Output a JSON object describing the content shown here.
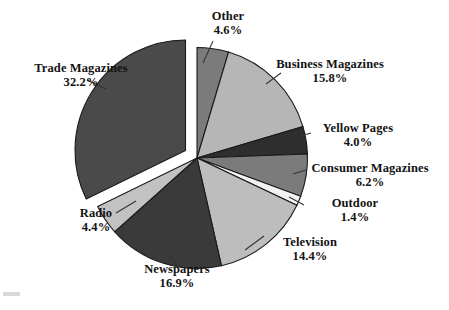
{
  "chart_data": {
    "type": "pie",
    "title": "",
    "subtitle": "",
    "xlabel": "",
    "ylabel": "",
    "units": "percent",
    "legend_position": "none",
    "labels_position": "outside-with-leader-lines",
    "grid": false,
    "start_angle_deg": 0,
    "direction": "clockwise",
    "total": 99.9,
    "categories": [
      "Other",
      "Business Magazines",
      "Yellow Pages",
      "Consumer Magazines",
      "Outdoor",
      "Television",
      "Newspapers",
      "Radio",
      "Trade Magazines"
    ],
    "values": [
      4.6,
      15.8,
      4.0,
      6.2,
      1.4,
      14.4,
      16.9,
      4.4,
      32.2
    ],
    "slices": [
      {
        "name": "Other",
        "value": 4.6,
        "value_text": "4.6%",
        "color": "#7b7b7b",
        "exploded": false
      },
      {
        "name": "Business Magazines",
        "value": 15.8,
        "value_text": "15.8%",
        "color": "#b6b6b6",
        "exploded": false
      },
      {
        "name": "Yellow Pages",
        "value": 4.0,
        "value_text": "4.0%",
        "color": "#2e2e2e",
        "exploded": false
      },
      {
        "name": "Consumer Magazines",
        "value": 6.2,
        "value_text": "6.2%",
        "color": "#7b7b7b",
        "exploded": false
      },
      {
        "name": "Outdoor",
        "value": 1.4,
        "value_text": "1.4%",
        "color": "#f2f2f2",
        "exploded": false
      },
      {
        "name": "Television",
        "value": 14.4,
        "value_text": "14.4%",
        "color": "#bdbdbd",
        "exploded": false
      },
      {
        "name": "Newspapers",
        "value": 16.9,
        "value_text": "16.9%",
        "color": "#3a3a3a",
        "exploded": false
      },
      {
        "name": "Radio",
        "value": 4.4,
        "value_text": "4.4%",
        "color": "#c2c2c2",
        "exploded": false
      },
      {
        "name": "Trade Magazines",
        "value": 32.2,
        "value_text": "32.2%",
        "color": "#4a4a4a",
        "exploded": true
      }
    ],
    "colors": {
      "background": "#ffffff",
      "outline": "#1a1a1a",
      "text": "#131313",
      "leader_line": "#333333"
    }
  }
}
